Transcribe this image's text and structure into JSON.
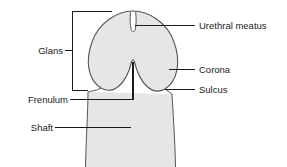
{
  "figure": {
    "type": "labeled-anatomical-diagram",
    "background_color": "#ffffff"
  },
  "colors": {
    "organ_fill": "#e6e6e6",
    "organ_outline": "#4d4d4d",
    "leader_line": "#1a1a1a",
    "text": "#1a1a1a"
  },
  "labels": {
    "glans": "Glans",
    "frenulum": "Frenulum",
    "shaft": "Shaft",
    "urethral_meatus": "Urethral meatus",
    "corona": "Corona",
    "sulcus": "Sulcus"
  },
  "annotations": [
    {
      "name": "glans",
      "text": "Glans",
      "side": "left",
      "connector": "bracket"
    },
    {
      "name": "frenulum",
      "text": "Frenulum",
      "side": "left",
      "connector": "elbow"
    },
    {
      "name": "shaft",
      "text": "Shaft",
      "side": "left",
      "connector": "line"
    },
    {
      "name": "urethral-meatus",
      "text": "Urethral meatus",
      "side": "right",
      "connector": "line"
    },
    {
      "name": "corona",
      "text": "Corona",
      "side": "right",
      "connector": "line"
    },
    {
      "name": "sulcus",
      "text": "Sulcus",
      "side": "right",
      "connector": "line"
    }
  ]
}
